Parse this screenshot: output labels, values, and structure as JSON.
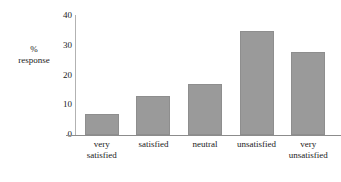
{
  "chart_data": {
    "type": "bar",
    "title": "",
    "xlabel": "",
    "ylabel": "% response",
    "ylabel_lines": [
      "%",
      "response"
    ],
    "categories": [
      "very satisfied",
      "satisfied",
      "neutral",
      "unsatisfied",
      "very unsatisfied"
    ],
    "category_label_lines": [
      [
        "very",
        "satisfied"
      ],
      [
        "satisfied"
      ],
      [
        "neutral"
      ],
      [
        "unsatisfied"
      ],
      [
        "very",
        "unsatisfied"
      ]
    ],
    "values": [
      7,
      13,
      17,
      35,
      28
    ],
    "ylim": [
      0,
      40
    ],
    "yticks": [
      0,
      10,
      20,
      30,
      40
    ],
    "ytick_labels": [
      "0",
      "10",
      "20",
      "30",
      "40"
    ],
    "grid": false,
    "legend": false,
    "bar_color": "#9a9a9a",
    "bar_border_color": "#8e8e8e",
    "axis_color": "#8c8c8c",
    "text_color": "#1a1a1a"
  }
}
